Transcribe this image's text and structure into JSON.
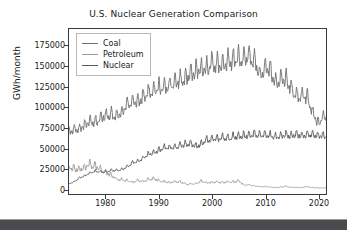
{
  "chart_data": {
    "type": "line",
    "title": "U.S. Nuclear Generation Comparison",
    "xlabel": "",
    "ylabel": "GWh/month",
    "xlim": [
      1973.0,
      2021.5
    ],
    "ylim": [
      -6000,
      196000
    ],
    "grid": false,
    "legend_position": "upper left",
    "x_ticks": [
      "1980",
      "1990",
      "2000",
      "2010",
      "2020"
    ],
    "x_tick_values": [
      1980,
      1990,
      2000,
      2010,
      2020
    ],
    "y_ticks": [
      "0",
      "25000",
      "50000",
      "75000",
      "100000",
      "125000",
      "150000",
      "175000"
    ],
    "y_tick_values": [
      0,
      25000,
      50000,
      75000,
      100000,
      125000,
      150000,
      175000
    ],
    "series": [
      {
        "name": "Coal",
        "color": "#6e6e6e",
        "x": [
          1973.0,
          1974.0,
          1975.0,
          1976.0,
          1977.0,
          1978.0,
          1979.0,
          1980.0,
          1981.0,
          1982.0,
          1983.0,
          1984.0,
          1985.0,
          1986.0,
          1987.0,
          1988.0,
          1989.0,
          1990.0,
          1991.0,
          1992.0,
          1993.0,
          1994.0,
          1995.0,
          1996.0,
          1997.0,
          1998.0,
          1999.0,
          2000.0,
          2001.0,
          2002.0,
          2003.0,
          2004.0,
          2005.0,
          2006.0,
          2007.0,
          2008.0,
          2009.0,
          2010.0,
          2011.0,
          2012.0,
          2013.0,
          2014.0,
          2015.0,
          2016.0,
          2017.0,
          2018.0,
          2019.0,
          2020.0,
          2021.0
        ],
        "values": [
          71000,
          73000,
          74000,
          79000,
          83000,
          82000,
          88000,
          90000,
          91000,
          89000,
          95000,
          104000,
          107000,
          107000,
          113000,
          119000,
          122000,
          124000,
          124000,
          126000,
          131000,
          133000,
          135000,
          141000,
          144000,
          147000,
          148000,
          155000,
          152000,
          153000,
          155000,
          157000,
          160000,
          159000,
          162000,
          159000,
          140000,
          150000,
          145000,
          129000,
          134000,
          136000,
          121000,
          114000,
          114000,
          112000,
          93000,
          80000,
          88000
        ],
        "note": "monthly series with strong seasonal oscillation, amplitude roughly +/-12000 GWh; peaks near 190000 around 2007, sharp decline after 2010 to about 40000-88000 by 2020-2021"
      },
      {
        "name": "Petroleum",
        "color": "#9c9c9c",
        "x": [
          1973.0,
          1974.0,
          1975.0,
          1976.0,
          1977.0,
          1978.0,
          1979.0,
          1980.0,
          1981.0,
          1982.0,
          1983.0,
          1984.0,
          1985.0,
          1986.0,
          1987.0,
          1988.0,
          1989.0,
          1990.0,
          1991.0,
          1992.0,
          1993.0,
          1994.0,
          1995.0,
          1996.0,
          1997.0,
          1998.0,
          1999.0,
          2000.0,
          2001.0,
          2002.0,
          2003.0,
          2004.0,
          2005.0,
          2006.0,
          2007.0,
          2008.0,
          2009.0,
          2010.0,
          2011.0,
          2012.0,
          2013.0,
          2014.0,
          2015.0,
          2016.0,
          2017.0,
          2018.0,
          2019.0,
          2020.0,
          2021.0
        ],
        "values": [
          26000,
          25000,
          24000,
          27000,
          30000,
          28000,
          24000,
          20000,
          17000,
          12000,
          12000,
          10000,
          8000,
          11000,
          9000,
          12000,
          13000,
          10000,
          9000,
          8000,
          9000,
          9000,
          6000,
          6000,
          7000,
          10000,
          8000,
          8000,
          9000,
          8000,
          9000,
          9000,
          10000,
          5000,
          5000,
          4000,
          3000,
          3000,
          2500,
          2000,
          2500,
          3500,
          2000,
          2000,
          2000,
          3000,
          1800,
          1500,
          1500
        ],
        "note": "starts near 25000-32000 in mid 1970s, drops steeply through early 1980s to below 12000, then slow decline to near zero by 2010s"
      },
      {
        "name": "Nuclear",
        "color": "#5a5a5a",
        "x": [
          1973.0,
          1974.0,
          1975.0,
          1976.0,
          1977.0,
          1978.0,
          1979.0,
          1980.0,
          1981.0,
          1982.0,
          1983.0,
          1984.0,
          1985.0,
          1986.0,
          1987.0,
          1988.0,
          1989.0,
          1990.0,
          1991.0,
          1992.0,
          1993.0,
          1994.0,
          1995.0,
          1996.0,
          1997.0,
          1998.0,
          1999.0,
          2000.0,
          2001.0,
          2002.0,
          2003.0,
          2004.0,
          2005.0,
          2006.0,
          2007.0,
          2008.0,
          2009.0,
          2010.0,
          2011.0,
          2012.0,
          2013.0,
          2014.0,
          2015.0,
          2016.0,
          2017.0,
          2018.0,
          2019.0,
          2020.0,
          2021.0
        ],
        "values": [
          6500,
          9000,
          14000,
          16000,
          20000,
          22000,
          21000,
          21000,
          23000,
          23000,
          24000,
          28000,
          32000,
          34000,
          38000,
          43000,
          44000,
          48000,
          51000,
          51000,
          51000,
          53000,
          55000,
          56000,
          52000,
          56000,
          60000,
          62000,
          62000,
          63000,
          62000,
          64000,
          65000,
          65000,
          66000,
          67000,
          66000,
          67000,
          66000,
          64000,
          65000,
          66000,
          66000,
          67000,
          66000,
          67000,
          67000,
          65000,
          65000
        ],
        "note": "rises from about 6000 in 1973 to a plateau near 65000-70000 from 2000 onward, with monthly oscillation of roughly +/-6000"
      }
    ]
  },
  "legend": {
    "items": [
      {
        "label": "Coal",
        "color": "#6e6e6e"
      },
      {
        "label": "Petroleum",
        "color": "#9c9c9c"
      },
      {
        "label": "Nuclear",
        "color": "#5a5a5a"
      }
    ]
  }
}
